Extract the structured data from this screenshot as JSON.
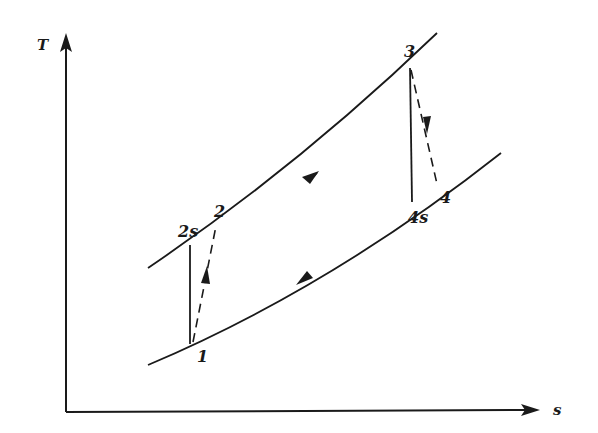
{
  "diagram": {
    "type": "T-s diagram (Brayton cycle with non-isentropic compression and expansion)",
    "axes": {
      "y_label": "T",
      "x_label": "s"
    },
    "points": [
      {
        "id": "1",
        "label": "1"
      },
      {
        "id": "2s",
        "label": "2s"
      },
      {
        "id": "2",
        "label": "2"
      },
      {
        "id": "3",
        "label": "3"
      },
      {
        "id": "4s",
        "label": "4s"
      },
      {
        "id": "4",
        "label": "4"
      }
    ],
    "curves": [
      {
        "name": "high-pressure isobar",
        "direction": "2 to 3"
      },
      {
        "name": "low-pressure isobar",
        "direction": "4 to 1"
      },
      {
        "name": "isentropic compression 1-2s",
        "style": "solid"
      },
      {
        "name": "actual compression 1-2",
        "style": "dashed"
      },
      {
        "name": "isentropic expansion 3-4s",
        "style": "solid"
      },
      {
        "name": "actual expansion 3-4",
        "style": "dashed"
      }
    ],
    "colors": {
      "ink": "#1a1a1a",
      "background": "#ffffff"
    }
  }
}
